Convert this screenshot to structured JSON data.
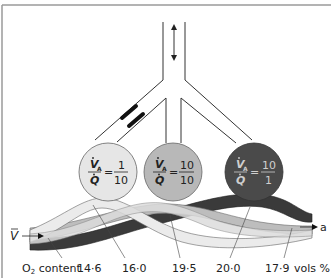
{
  "diagram": {
    "units": [
      {
        "id": "low",
        "ratio_numerator_symbol": "V",
        "ratio_numerator_sub": "A",
        "ratio_denominator_symbol": "Q",
        "equals": "=",
        "value_numerator": "1",
        "value_denominator": "10",
        "fill": "#e6e6e6",
        "text_color": "#222222"
      },
      {
        "id": "normal",
        "ratio_numerator_symbol": "V",
        "ratio_numerator_sub": "A",
        "ratio_denominator_symbol": "Q",
        "equals": "=",
        "value_numerator": "10",
        "value_denominator": "10",
        "fill": "#b8b8b8",
        "text_color": "#222222"
      },
      {
        "id": "high",
        "ratio_numerator_symbol": "V",
        "ratio_numerator_sub": "A",
        "ratio_denominator_symbol": "Q",
        "equals": "=",
        "value_numerator": "10",
        "value_denominator": "1",
        "fill": "#4a4a4a",
        "text_color": "#cfcfcf"
      }
    ],
    "venous_label": "V",
    "arterial_label": "a",
    "o2_label_prefix": "O",
    "o2_label_sub": "2",
    "o2_label_suffix": " content",
    "o2_values": [
      "14·6",
      "16·0",
      "19·5",
      "20·0",
      "17·9"
    ],
    "units_label": "vols %",
    "colors": {
      "frame": "#9a9a9a",
      "airway": "#333333",
      "vessel_dark": "#3a3a3a",
      "vessel_mid": "#bdbdbd",
      "vessel_light": "#e9e9e9"
    }
  }
}
